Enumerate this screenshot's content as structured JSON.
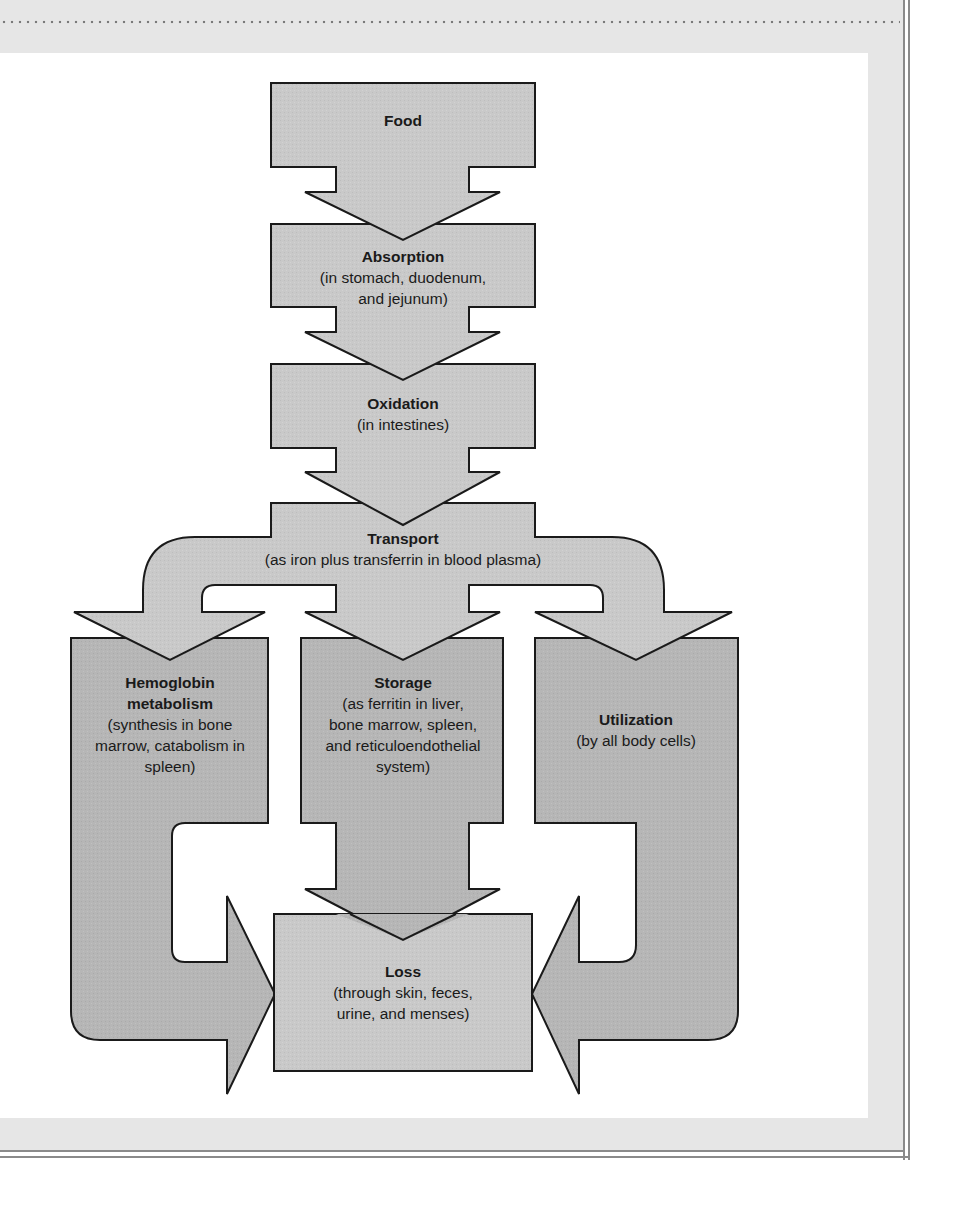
{
  "figure": {
    "type": "flowchart"
  },
  "colors": {
    "page_background": "#e6e6e6",
    "panel_background": "#ffffff",
    "shape_fill_light": "#c8c8c8",
    "shape_fill_dark": "#b4b4b4",
    "outline": "#1a1a1a",
    "frame_line": "#8a8a8a"
  },
  "nodes": {
    "food": {
      "title": "Food",
      "desc": ""
    },
    "absorption": {
      "title": "Absorption",
      "desc": "(in stomach, duodenum, and jejunum)",
      "desc_lines": [
        "(in stomach, duodenum,",
        "and jejunum)"
      ]
    },
    "oxidation": {
      "title": "Oxidation",
      "desc": "(in intestines)"
    },
    "transport": {
      "title": "Transport",
      "desc": "(as iron plus transferrin in blood plasma)"
    },
    "hemoglobin": {
      "title": "Hemoglobin metabolism",
      "title_lines": [
        "Hemoglobin",
        "metabolism"
      ],
      "desc": "(synthesis in bone marrow, catabolism in spleen)",
      "desc_lines": [
        "(synthesis in bone",
        "marrow, catabolism in",
        "spleen)"
      ]
    },
    "storage": {
      "title": "Storage",
      "desc": "(as ferritin in liver, bone marrow, spleen, and reticuloendothelial system)",
      "desc_lines": [
        "(as ferritin in liver,",
        "bone marrow, spleen,",
        "and reticuloendothelial",
        "system)"
      ]
    },
    "utilization": {
      "title": "Utilization",
      "desc": "(by all body cells)"
    },
    "loss": {
      "title": "Loss",
      "desc": "(through skin, feces, urine, and menses)",
      "desc_lines": [
        "(through skin, feces,",
        "urine, and menses)"
      ]
    }
  },
  "edges": [
    {
      "from": "Food",
      "to": "Absorption"
    },
    {
      "from": "Absorption",
      "to": "Oxidation"
    },
    {
      "from": "Oxidation",
      "to": "Transport"
    },
    {
      "from": "Transport",
      "to": "Hemoglobin metabolism"
    },
    {
      "from": "Transport",
      "to": "Storage"
    },
    {
      "from": "Transport",
      "to": "Utilization"
    },
    {
      "from": "Hemoglobin metabolism",
      "to": "Loss"
    },
    {
      "from": "Storage",
      "to": "Loss"
    },
    {
      "from": "Utilization",
      "to": "Loss"
    }
  ]
}
